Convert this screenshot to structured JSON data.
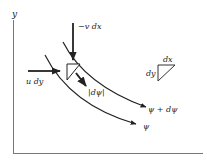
{
  "diagram": {
    "type": "stream-function-element",
    "axes": {
      "x_label": "",
      "y_label": "y"
    },
    "labels": {
      "vertical_flux": "−v dx",
      "horizontal_flux": "u  dy",
      "delta_psi": "|dψ|",
      "outer_streamline": "ψ + dψ",
      "inner_streamline": "ψ",
      "legend_dx": "dx",
      "legend_dy": "dy"
    },
    "colors": {
      "line": "#222222",
      "background": "#ffffff"
    }
  }
}
